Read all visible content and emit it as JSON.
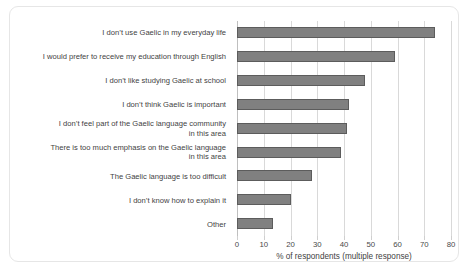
{
  "chart_data": {
    "type": "bar",
    "orientation": "horizontal",
    "title": "",
    "xlabel": "% of respondents (multiple response)",
    "ylabel": "",
    "xlim": [
      0,
      80
    ],
    "xticks": [
      0,
      10,
      20,
      30,
      40,
      50,
      60,
      70,
      80
    ],
    "grid": "vertical",
    "legend": "none",
    "bar_color": "#808080",
    "bar_border_color": "#5c5c5c",
    "gridline_color": "#d9d9d9",
    "categories": [
      "I don’t use Gaelic in my everyday life",
      "I would prefer to receive my education through English",
      "I don’t like studying Gaelic at school",
      "I don’t think Gaelic is important",
      "I don’t feel part of the Gaelic language community\nin this area",
      "There is too much emphasis on the Gaelic language\nin this area",
      "The Gaelic language is too difficult",
      "I don’t know how to explain it",
      "Other"
    ],
    "values": [
      74,
      59,
      48,
      42,
      41,
      39,
      28,
      20,
      13.5
    ]
  }
}
